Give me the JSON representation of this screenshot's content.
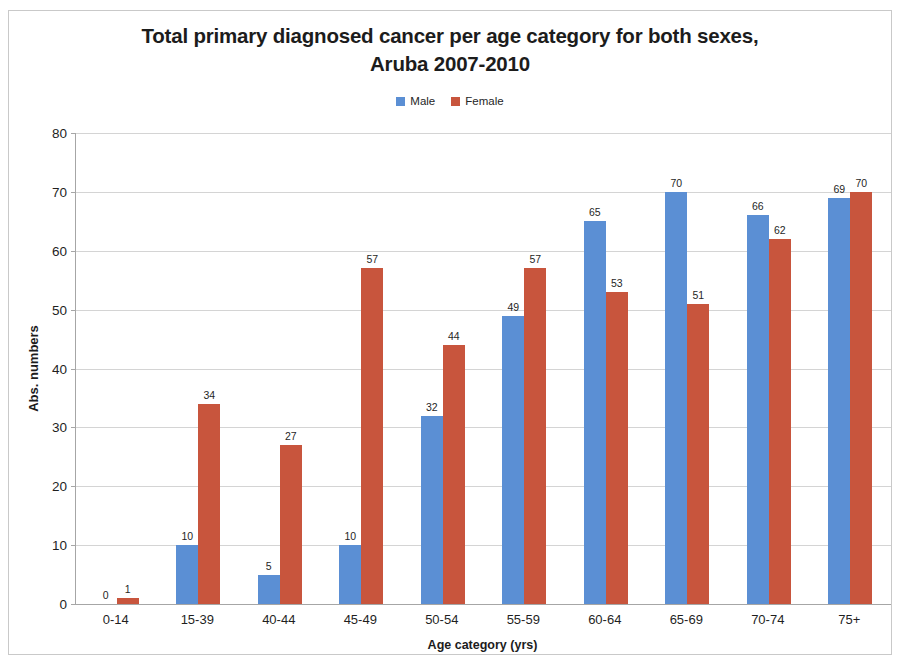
{
  "chart_data": {
    "type": "bar",
    "title": "Total primary diagnosed cancer per age category for both sexes, Aruba 2007-2010",
    "title_line1": "Total primary diagnosed cancer per age category for both sexes,",
    "title_line2": "Aruba 2007-2010",
    "xlabel": "Age category (yrs)",
    "ylabel": "Abs. numbers",
    "categories": [
      "0-14",
      "15-39",
      "40-44",
      "45-49",
      "50-54",
      "55-59",
      "60-64",
      "65-69",
      "70-74",
      "75+"
    ],
    "series": [
      {
        "name": "Male",
        "color": "#5b8fd4",
        "values": [
          0,
          10,
          5,
          10,
          32,
          49,
          65,
          70,
          66,
          69
        ]
      },
      {
        "name": "Female",
        "color": "#c8553d",
        "values": [
          1,
          34,
          27,
          57,
          44,
          57,
          53,
          51,
          62,
          70
        ]
      }
    ],
    "ylim": [
      0,
      80
    ],
    "yticks": [
      0,
      10,
      20,
      30,
      40,
      50,
      60,
      70,
      80
    ],
    "grid": true,
    "legend_position": "top-center",
    "data_labels": true
  }
}
